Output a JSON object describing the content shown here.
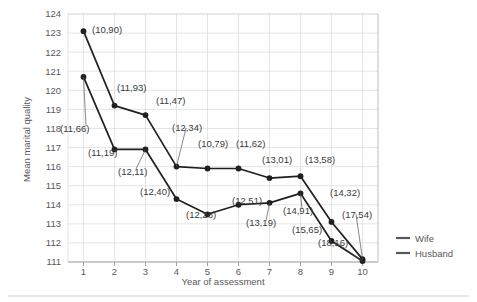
{
  "chart_data": {
    "type": "line",
    "title": "",
    "xlabel": "Year of assessment",
    "ylabel": "Mean marital quality",
    "x": [
      1,
      2,
      3,
      4,
      5,
      6,
      7,
      8,
      9,
      10
    ],
    "xtick_labels": [
      "1",
      "2",
      "3",
      "4",
      "5",
      "6",
      "7",
      "8",
      "9",
      "10"
    ],
    "ytick_labels": [
      "111",
      "112",
      "113",
      "114",
      "115",
      "116",
      "117",
      "118",
      "119",
      "120",
      "121",
      "122",
      "123",
      "124"
    ],
    "ylim": [
      111,
      124
    ],
    "xlim": [
      0.5,
      10.5
    ],
    "grid": true,
    "legend_position": "right",
    "series": [
      {
        "name": "Wife",
        "color": "#231f20",
        "values": [
          123.1,
          119.2,
          118.7,
          116.0,
          115.9,
          115.9,
          115.4,
          115.5,
          113.1,
          111.15
        ],
        "point_labels": [
          "(10,90)",
          "(11,93)",
          "(11,47)",
          "(12,34)",
          "(10,79)",
          "(11,62)",
          "(13,01)",
          "(13,58)",
          "(14,32)",
          "(17,54)"
        ]
      },
      {
        "name": "Husband",
        "color": "#231f20",
        "values": [
          120.7,
          116.9,
          116.9,
          114.3,
          113.5,
          114.0,
          114.1,
          114.6,
          112.1,
          111.05
        ],
        "point_labels": [
          "(11,66)",
          "(11,19)",
          "(12,11)",
          "(12,40)",
          "(12,28)",
          "(12,51)",
          "(13,19)",
          "(14,91)",
          "(15,65)",
          "(18,16)"
        ]
      }
    ],
    "annotations": [
      {
        "text": "(10,90)",
        "x": 92,
        "y": 33,
        "anchor": "start"
      },
      {
        "text": "(11,93)",
        "x": 117,
        "y": 91,
        "anchor": "start"
      },
      {
        "text": "(11,47)",
        "x": 156,
        "y": 104,
        "anchor": "start"
      },
      {
        "text": "(12,34)",
        "x": 172,
        "y": 131,
        "anchor": "start"
      },
      {
        "text": "(10,79)",
        "x": 198,
        "y": 147,
        "anchor": "start"
      },
      {
        "text": "(11,62)",
        "x": 236,
        "y": 147,
        "anchor": "start"
      },
      {
        "text": "(13,01)",
        "x": 262,
        "y": 163,
        "anchor": "start"
      },
      {
        "text": "(13,58)",
        "x": 305,
        "y": 163,
        "anchor": "start"
      },
      {
        "text": "(14,32)",
        "x": 330,
        "y": 196,
        "anchor": "start"
      },
      {
        "text": "(17,54)",
        "x": 342,
        "y": 218,
        "anchor": "start"
      },
      {
        "text": "(11,66)",
        "x": 60,
        "y": 132,
        "anchor": "start"
      },
      {
        "text": "(11,19)",
        "x": 88,
        "y": 156,
        "anchor": "start"
      },
      {
        "text": "(12,11)",
        "x": 118,
        "y": 175,
        "anchor": "start"
      },
      {
        "text": "(12,40)",
        "x": 140,
        "y": 195,
        "anchor": "start"
      },
      {
        "text": "(12,28)",
        "x": 186,
        "y": 218,
        "anchor": "start"
      },
      {
        "text": "(12,51)",
        "x": 232,
        "y": 204,
        "anchor": "start"
      },
      {
        "text": "(13,19)",
        "x": 246,
        "y": 226,
        "anchor": "start"
      },
      {
        "text": "(14,91)",
        "x": 283,
        "y": 214,
        "anchor": "start"
      },
      {
        "text": "(15,65)",
        "x": 292,
        "y": 233,
        "anchor": "start"
      },
      {
        "text": "(18,16)",
        "x": 318,
        "y": 246,
        "anchor": "start"
      }
    ]
  },
  "legend": {
    "items": [
      {
        "label": "Wife"
      },
      {
        "label": "Husband"
      }
    ]
  },
  "axes": {
    "x_title": "Year of assessment",
    "y_title": "Mean marital quality"
  }
}
